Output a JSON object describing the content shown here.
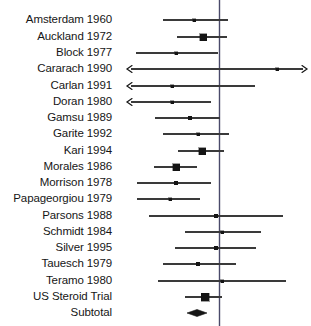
{
  "chart_data": {
    "type": "forest",
    "title": "",
    "xlabel": "",
    "ylabel": "",
    "reference_line_value": 1.0,
    "reference_line_x_px": 219.5,
    "x_axis_px": {
      "left": 120,
      "right": 311
    },
    "grid": false,
    "legend": null,
    "marker_color": "#151515",
    "line_color": "#3a3a3a",
    "reference_color": "#4a4a6a",
    "rows": [
      {
        "label": "Amsterdam 1960",
        "y": 20,
        "ci_low_px": 163,
        "ci_high_px": 228,
        "point_px": 194,
        "marker": "square",
        "marker_size": 3,
        "arrow_left": false,
        "arrow_right": false
      },
      {
        "label": "Auckland 1972",
        "y": 37,
        "ci_low_px": 177,
        "ci_high_px": 227,
        "point_px": 203,
        "marker": "square",
        "marker_size": 7,
        "arrow_left": false,
        "arrow_right": false
      },
      {
        "label": "Block 1977",
        "y": 53,
        "ci_low_px": 136,
        "ci_high_px": 218,
        "point_px": 176,
        "marker": "square",
        "marker_size": 3,
        "arrow_left": false,
        "arrow_right": false
      },
      {
        "label": "Cararach 1990",
        "y": 69,
        "ci_low_px": 127,
        "ci_high_px": 307,
        "point_px": 277,
        "marker": "square",
        "marker_size": 3,
        "arrow_left": true,
        "arrow_right": true
      },
      {
        "label": "Carlan 1991",
        "y": 86,
        "ci_low_px": 127,
        "ci_high_px": 255,
        "point_px": 172,
        "marker": "square",
        "marker_size": 3,
        "arrow_left": true,
        "arrow_right": false
      },
      {
        "label": "Doran 1980",
        "y": 102,
        "ci_low_px": 127,
        "ci_high_px": 211,
        "point_px": 172,
        "marker": "square",
        "marker_size": 3,
        "arrow_left": true,
        "arrow_right": false
      },
      {
        "label": "Gamsu 1989",
        "y": 118,
        "ci_low_px": 155,
        "ci_high_px": 220,
        "point_px": 190,
        "marker": "square",
        "marker_size": 3.5,
        "arrow_left": false,
        "arrow_right": false
      },
      {
        "label": "Garite 1992",
        "y": 134,
        "ci_low_px": 163,
        "ci_high_px": 229,
        "point_px": 198,
        "marker": "square",
        "marker_size": 3,
        "arrow_left": false,
        "arrow_right": false
      },
      {
        "label": "Kari 1994",
        "y": 151,
        "ci_low_px": 178,
        "ci_high_px": 224,
        "point_px": 202,
        "marker": "square",
        "marker_size": 7,
        "arrow_left": false,
        "arrow_right": false
      },
      {
        "label": "Morales 1986",
        "y": 167,
        "ci_low_px": 154,
        "ci_high_px": 197,
        "point_px": 176,
        "marker": "square",
        "marker_size": 7,
        "arrow_left": false,
        "arrow_right": false
      },
      {
        "label": "Morrison 1978",
        "y": 183,
        "ci_low_px": 137,
        "ci_high_px": 211,
        "point_px": 176,
        "marker": "square",
        "marker_size": 3.5,
        "arrow_left": false,
        "arrow_right": false
      },
      {
        "label": "Papageorgiou 1979",
        "y": 199,
        "ci_low_px": 137,
        "ci_high_px": 200,
        "point_px": 170,
        "marker": "square",
        "marker_size": 3,
        "arrow_left": false,
        "arrow_right": false
      },
      {
        "label": "Parsons 1988",
        "y": 216,
        "ci_low_px": 149,
        "ci_high_px": 283,
        "point_px": 216,
        "marker": "square",
        "marker_size": 3.5,
        "arrow_left": false,
        "arrow_right": false
      },
      {
        "label": "Schmidt 1984",
        "y": 232,
        "ci_low_px": 185,
        "ci_high_px": 261,
        "point_px": 222,
        "marker": "square",
        "marker_size": 3,
        "arrow_left": false,
        "arrow_right": false
      },
      {
        "label": "Silver 1995",
        "y": 248,
        "ci_low_px": 175,
        "ci_high_px": 256,
        "point_px": 216,
        "marker": "square",
        "marker_size": 3.5,
        "arrow_left": false,
        "arrow_right": false
      },
      {
        "label": "Tauesch 1979",
        "y": 264,
        "ci_low_px": 163,
        "ci_high_px": 236,
        "point_px": 198,
        "marker": "square",
        "marker_size": 3.5,
        "arrow_left": false,
        "arrow_right": false
      },
      {
        "label": "Teramo 1980",
        "y": 281,
        "ci_low_px": 158,
        "ci_high_px": 286,
        "point_px": 222,
        "marker": "square",
        "marker_size": 3,
        "arrow_left": false,
        "arrow_right": false
      },
      {
        "label": "US Steroid Trial",
        "y": 297,
        "ci_low_px": 185,
        "ci_high_px": 222,
        "point_px": 205,
        "marker": "square",
        "marker_size": 8,
        "arrow_left": false,
        "arrow_right": false
      }
    ],
    "summary": {
      "label": "Subtotal",
      "y": 313,
      "marker": "diamond",
      "left_px": 187,
      "right_px": 207,
      "center_px": 197,
      "half_height_px": 3.5
    }
  }
}
